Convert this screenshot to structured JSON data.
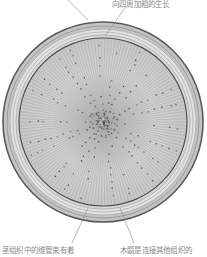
{
  "diagram": {
    "labels": {
      "top": "向四周加粗的生长",
      "bottom_left": "茎组织中的维管束有着",
      "bottom_right": "木髓是连接其他组织的"
    },
    "colors": {
      "background": "#ffffff",
      "outline": "#5a5a5a",
      "bark_band": "#b8b8b8",
      "bark_light": "#d6d6d6",
      "wood": "#cfcfcf",
      "ray_lines": "#a0a0a0",
      "vessels": "#4a4a4a",
      "leader_lines": "#8a8a8a",
      "label_text": "#8a8a8a"
    }
  }
}
